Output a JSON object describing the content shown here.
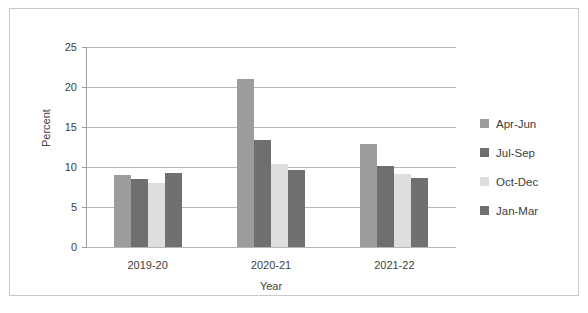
{
  "chart_data": {
    "type": "bar",
    "title": "",
    "xlabel": "Year",
    "ylabel": "Percent",
    "categories": [
      "2019-20",
      "2020-21",
      "2021-22"
    ],
    "series": [
      {
        "name": "Apr-Jun",
        "color": "#9c9c9c",
        "values": [
          9.0,
          21.0,
          12.9
        ]
      },
      {
        "name": "Jul-Sep",
        "color": "#6f6f6f",
        "values": [
          8.5,
          13.4,
          10.1
        ]
      },
      {
        "name": "Oct-Dec",
        "color": "#dedede",
        "values": [
          8.0,
          10.4,
          9.1
        ]
      },
      {
        "name": "Jan-Mar",
        "color": "#707070",
        "values": [
          9.3,
          9.6,
          8.6
        ]
      }
    ],
    "ylim": [
      0,
      25
    ],
    "yticks": [
      0,
      5,
      10,
      15,
      20,
      25
    ],
    "ytick_labels": [
      "0",
      "5",
      "10",
      "15",
      "20",
      "25"
    ],
    "grid": true,
    "legend_position": "right"
  },
  "legend": {
    "items": [
      {
        "label": "Apr-Jun"
      },
      {
        "label": "Jul-Sep"
      },
      {
        "label": "Oct-Dec"
      },
      {
        "label": "Jan-Mar"
      }
    ]
  },
  "axis": {
    "y_title": "Percent",
    "x_title": "Year"
  }
}
